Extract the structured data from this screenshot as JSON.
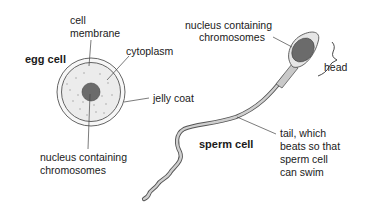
{
  "diagram": {
    "type": "biology labelled diagram",
    "colors": {
      "background": "#ffffff",
      "outline": "#555555",
      "leader_line": "#444444",
      "cytoplasm_fill": "#eeeeee",
      "nucleus_fill": "#6b6b6b",
      "tail_fill": "#cfcfcf",
      "text": "#1a1a1a"
    },
    "egg_cell": {
      "title": "egg cell",
      "labels": {
        "membrane_line1": "cell",
        "membrane_line2": "membrane",
        "cytoplasm": "cytoplasm",
        "jelly_coat": "jelly coat",
        "nucleus_line1": "nucleus containing",
        "nucleus_line2": "chromosomes"
      }
    },
    "sperm_cell": {
      "title": "sperm cell",
      "labels": {
        "nucleus_line1": "nucleus containing",
        "nucleus_line2": "chromosomes",
        "head": "head",
        "tail_line1": "tail, which",
        "tail_line2": "beats so that",
        "tail_line3": "sperm cell",
        "tail_line4": "can swim"
      }
    }
  }
}
